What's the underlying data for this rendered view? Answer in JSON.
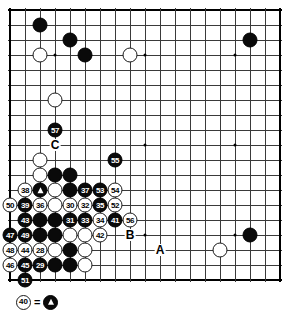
{
  "diagram": {
    "type": "go-board-diagram",
    "board": {
      "columns": 18,
      "rows": 18,
      "line_color": "#3a3a3a",
      "edge_color": "#000000",
      "background": "#ffffff",
      "star_points": [
        [
          3,
          3
        ],
        [
          9,
          3
        ],
        [
          15,
          3
        ],
        [
          3,
          9
        ],
        [
          9,
          9
        ],
        [
          15,
          9
        ],
        [
          3,
          15
        ],
        [
          9,
          15
        ],
        [
          15,
          15
        ]
      ]
    },
    "stones": [
      {
        "id": "s-b-c2r1",
        "col": 2,
        "row": 1,
        "color": "black",
        "label": ""
      },
      {
        "id": "s-b-c4r2",
        "col": 4,
        "row": 2,
        "color": "black",
        "label": ""
      },
      {
        "id": "s-w-c2r3",
        "col": 2,
        "row": 3,
        "color": "white",
        "label": ""
      },
      {
        "id": "s-b-c5r3",
        "col": 5,
        "row": 3,
        "color": "black",
        "label": ""
      },
      {
        "id": "s-w-c8r3",
        "col": 8,
        "row": 3,
        "color": "white",
        "label": ""
      },
      {
        "id": "s-b-c16r2",
        "col": 16,
        "row": 2,
        "color": "black",
        "label": ""
      },
      {
        "id": "s-w-c3r6",
        "col": 3,
        "row": 6,
        "color": "white",
        "label": ""
      },
      {
        "id": "s-b-c3r8",
        "col": 3,
        "row": 8,
        "color": "black",
        "label": "57"
      },
      {
        "id": "s-b-c7r10",
        "col": 7,
        "row": 10,
        "color": "black",
        "label": "55"
      },
      {
        "id": "s-w-c2r10",
        "col": 2,
        "row": 10,
        "color": "white",
        "label": ""
      },
      {
        "id": "s-w-c2r11",
        "col": 2,
        "row": 11,
        "color": "white",
        "label": ""
      },
      {
        "id": "s-b-c3r11",
        "col": 3,
        "row": 11,
        "color": "black",
        "label": ""
      },
      {
        "id": "s-b-c4r11",
        "col": 4,
        "row": 11,
        "color": "black",
        "label": ""
      },
      {
        "id": "s-w-c1r12",
        "col": 1,
        "row": 12,
        "color": "white",
        "label": "38"
      },
      {
        "id": "s-b-c2r12",
        "col": 2,
        "row": 12,
        "color": "black",
        "label": "TRI"
      },
      {
        "id": "s-w-c3r12",
        "col": 3,
        "row": 12,
        "color": "white",
        "label": ""
      },
      {
        "id": "s-b-c4r12",
        "col": 4,
        "row": 12,
        "color": "black",
        "label": ""
      },
      {
        "id": "s-b-c5r12",
        "col": 5,
        "row": 12,
        "color": "black",
        "label": "37"
      },
      {
        "id": "s-b-c6r12",
        "col": 6,
        "row": 12,
        "color": "black",
        "label": "53"
      },
      {
        "id": "s-w-c7r12",
        "col": 7,
        "row": 12,
        "color": "white",
        "label": "54"
      },
      {
        "id": "s-w-c0r13",
        "col": 0,
        "row": 13,
        "color": "white",
        "label": "50"
      },
      {
        "id": "s-b-c1r13",
        "col": 1,
        "row": 13,
        "color": "black",
        "label": "39"
      },
      {
        "id": "s-w-c2r13",
        "col": 2,
        "row": 13,
        "color": "white",
        "label": "36"
      },
      {
        "id": "s-w-c3r13",
        "col": 3,
        "row": 13,
        "color": "white",
        "label": ""
      },
      {
        "id": "s-w-c4r13",
        "col": 4,
        "row": 13,
        "color": "white",
        "label": "30"
      },
      {
        "id": "s-w-c5r13",
        "col": 5,
        "row": 13,
        "color": "white",
        "label": "32"
      },
      {
        "id": "s-b-c6r13",
        "col": 6,
        "row": 13,
        "color": "black",
        "label": "35"
      },
      {
        "id": "s-w-c7r13",
        "col": 7,
        "row": 13,
        "color": "white",
        "label": "52"
      },
      {
        "id": "s-b-c1r14",
        "col": 1,
        "row": 14,
        "color": "black",
        "label": "43"
      },
      {
        "id": "s-b-c2r14",
        "col": 2,
        "row": 14,
        "color": "black",
        "label": ""
      },
      {
        "id": "s-b-c3r14",
        "col": 3,
        "row": 14,
        "color": "black",
        "label": ""
      },
      {
        "id": "s-b-c4r14",
        "col": 4,
        "row": 14,
        "color": "black",
        "label": "31"
      },
      {
        "id": "s-b-c5r14",
        "col": 5,
        "row": 14,
        "color": "black",
        "label": "33"
      },
      {
        "id": "s-w-c6r14",
        "col": 6,
        "row": 14,
        "color": "white",
        "label": "34"
      },
      {
        "id": "s-b-c7r14",
        "col": 7,
        "row": 14,
        "color": "black",
        "label": "41"
      },
      {
        "id": "s-w-c8r14",
        "col": 8,
        "row": 14,
        "color": "white",
        "label": "56"
      },
      {
        "id": "s-b-c0r15",
        "col": 0,
        "row": 15,
        "color": "black",
        "label": "47"
      },
      {
        "id": "s-b-c1r15",
        "col": 1,
        "row": 15,
        "color": "black",
        "label": "49"
      },
      {
        "id": "s-b-c2r15",
        "col": 2,
        "row": 15,
        "color": "black",
        "label": ""
      },
      {
        "id": "s-b-c3r15",
        "col": 3,
        "row": 15,
        "color": "black",
        "label": ""
      },
      {
        "id": "s-w-c4r15",
        "col": 4,
        "row": 15,
        "color": "white",
        "label": ""
      },
      {
        "id": "s-w-c5r15",
        "col": 5,
        "row": 15,
        "color": "white",
        "label": ""
      },
      {
        "id": "s-w-c6r15",
        "col": 6,
        "row": 15,
        "color": "white",
        "label": "42"
      },
      {
        "id": "s-w-c0r16",
        "col": 0,
        "row": 16,
        "color": "white",
        "label": "48"
      },
      {
        "id": "s-w-c1r16",
        "col": 1,
        "row": 16,
        "color": "white",
        "label": "44"
      },
      {
        "id": "s-w-c2r16",
        "col": 2,
        "row": 16,
        "color": "white",
        "label": "28"
      },
      {
        "id": "s-w-c3r16",
        "col": 3,
        "row": 16,
        "color": "white",
        "label": ""
      },
      {
        "id": "s-b-c4r16",
        "col": 4,
        "row": 16,
        "color": "black",
        "label": ""
      },
      {
        "id": "s-w-c5r16",
        "col": 5,
        "row": 16,
        "color": "white",
        "label": ""
      },
      {
        "id": "s-w-c0r17",
        "col": 0,
        "row": 17,
        "color": "white",
        "label": "46"
      },
      {
        "id": "s-b-c1r17",
        "col": 1,
        "row": 17,
        "color": "black",
        "label": "45"
      },
      {
        "id": "s-b-c2r17",
        "col": 2,
        "row": 17,
        "color": "black",
        "label": "29"
      },
      {
        "id": "s-b-c3r17",
        "col": 3,
        "row": 17,
        "color": "black",
        "label": ""
      },
      {
        "id": "s-b-c4r17",
        "col": 4,
        "row": 17,
        "color": "black",
        "label": ""
      },
      {
        "id": "s-w-c5r17",
        "col": 5,
        "row": 17,
        "color": "white",
        "label": ""
      },
      {
        "id": "s-b-c1r18",
        "col": 1,
        "row": 18,
        "color": "black",
        "label": "51"
      },
      {
        "id": "s-b-c16r15",
        "col": 16,
        "row": 15,
        "color": "black",
        "label": ""
      },
      {
        "id": "s-w-c14r16",
        "col": 14,
        "row": 16,
        "color": "white",
        "label": ""
      }
    ],
    "markers": [
      {
        "id": "m-c",
        "col": 3,
        "row": 9,
        "label": "C"
      },
      {
        "id": "m-b",
        "col": 8,
        "row": 15,
        "label": "B"
      },
      {
        "id": "m-a",
        "col": 10,
        "row": 16,
        "label": "A"
      }
    ],
    "caption": {
      "move_number": "40",
      "equals": "=",
      "target_symbol": "triangle-stone"
    }
  }
}
